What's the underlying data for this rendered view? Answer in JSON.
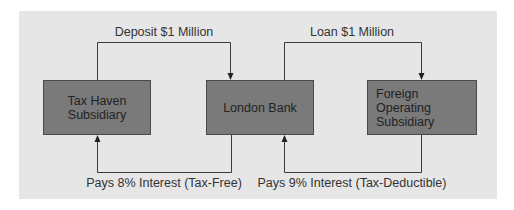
{
  "diagram": {
    "nodes": [
      {
        "id": "tax_haven",
        "label": "Tax Haven\nSubsidiary"
      },
      {
        "id": "london_bank",
        "label": "London Bank"
      },
      {
        "id": "foreign_op",
        "label": "Foreign Operating\nSubsidiary"
      }
    ],
    "edges": [
      {
        "from": "tax_haven",
        "to": "london_bank",
        "label": "Deposit $1 Million",
        "position": "top"
      },
      {
        "from": "london_bank",
        "to": "foreign_op",
        "label": "Loan $1 Million",
        "position": "top"
      },
      {
        "from": "london_bank",
        "to": "tax_haven",
        "label": "Pays 8% Interest (Tax-Free)",
        "position": "bottom"
      },
      {
        "from": "foreign_op",
        "to": "london_bank",
        "label": "Pays 9% Interest (Tax-Deductible)",
        "position": "bottom"
      }
    ]
  },
  "colors": {
    "panel_background": "#e6e6e6",
    "box_fill": "#7a7a7a",
    "box_border": "#4a4a4a",
    "line": "#3a3a3a",
    "text": "#333333"
  }
}
